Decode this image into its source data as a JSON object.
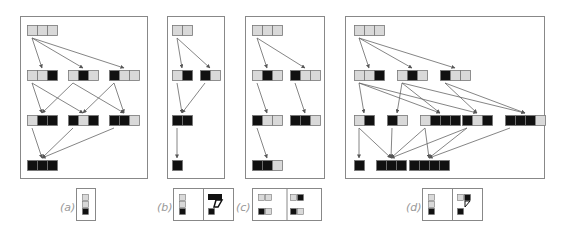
{
  "colors": {
    "light": "#d9d9d9",
    "dark": "#111111",
    "border": "#777777",
    "frame": "#888888",
    "arrow": "#666666"
  },
  "panels": [
    {
      "id": "a",
      "label": "(a)",
      "frame": [
        20,
        16,
        127,
        162
      ],
      "nodes": [
        {
          "x": 27,
          "y": 25,
          "cells": "ggg"
        },
        {
          "x": 27,
          "y": 70,
          "cells": "ggB"
        },
        {
          "x": 68,
          "y": 70,
          "cells": "gBg"
        },
        {
          "x": 109,
          "y": 70,
          "cells": "Bgg"
        },
        {
          "x": 27,
          "y": 115,
          "cells": "gBB"
        },
        {
          "x": 68,
          "y": 115,
          "cells": "BgB"
        },
        {
          "x": 109,
          "y": 115,
          "cells": "BBg"
        },
        {
          "x": 27,
          "y": 160,
          "cells": "BBB"
        }
      ],
      "edges": [
        [
          0,
          1
        ],
        [
          0,
          2
        ],
        [
          0,
          3
        ],
        [
          1,
          4
        ],
        [
          1,
          5
        ],
        [
          2,
          4
        ],
        [
          2,
          6
        ],
        [
          3,
          5
        ],
        [
          3,
          6
        ],
        [
          4,
          7
        ],
        [
          5,
          7
        ],
        [
          6,
          7
        ]
      ]
    },
    {
      "id": "b",
      "label": "(b)",
      "frame": [
        167,
        16,
        57,
        162
      ],
      "nodes": [
        {
          "x": 172,
          "y": 25,
          "cells": "gg"
        },
        {
          "x": 172,
          "y": 70,
          "cells": "gB"
        },
        {
          "x": 200,
          "y": 70,
          "cells": "Bg"
        },
        {
          "x": 172,
          "y": 115,
          "cells": "BB"
        },
        {
          "x": 172,
          "y": 160,
          "cells": "B"
        }
      ],
      "edges": [
        [
          0,
          1
        ],
        [
          0,
          2
        ],
        [
          1,
          3
        ],
        [
          2,
          3
        ],
        [
          3,
          4
        ]
      ]
    },
    {
      "id": "c",
      "label": "(c)",
      "frame": [
        245,
        16,
        79,
        162
      ],
      "nodes": [
        {
          "x": 252,
          "y": 25,
          "cells": "ggg"
        },
        {
          "x": 252,
          "y": 70,
          "cells": "gBg"
        },
        {
          "x": 290,
          "y": 70,
          "cells": "Bgg"
        },
        {
          "x": 252,
          "y": 115,
          "cells": "Bgg"
        },
        {
          "x": 290,
          "y": 115,
          "cells": "BBg"
        },
        {
          "x": 252,
          "y": 160,
          "cells": "BBg"
        }
      ],
      "edges": [
        [
          0,
          1
        ],
        [
          0,
          2
        ],
        [
          1,
          3
        ],
        [
          2,
          4
        ],
        [
          3,
          5
        ]
      ]
    },
    {
      "id": "d",
      "label": "(d)",
      "frame": [
        345,
        16,
        199,
        162
      ],
      "nodes": [
        {
          "x": 354,
          "y": 25,
          "cells": "ggg"
        },
        {
          "x": 354,
          "y": 70,
          "cells": "ggB"
        },
        {
          "x": 397,
          "y": 70,
          "cells": "gBg"
        },
        {
          "x": 440,
          "y": 70,
          "cells": "Bgg"
        },
        {
          "x": 354,
          "y": 115,
          "cells": "gB"
        },
        {
          "x": 387,
          "y": 115,
          "cells": "Bg"
        },
        {
          "x": 420,
          "y": 115,
          "cells": "gBBB"
        },
        {
          "x": 462,
          "y": 115,
          "cells": "BgB"
        },
        {
          "x": 505,
          "y": 115,
          "cells": "BBBg"
        },
        {
          "x": 354,
          "y": 160,
          "cells": "B"
        },
        {
          "x": 376,
          "y": 160,
          "cells": "BBB"
        },
        {
          "x": 409,
          "y": 160,
          "cells": "BBBB"
        }
      ],
      "edges": [
        [
          0,
          1
        ],
        [
          0,
          2
        ],
        [
          0,
          3
        ],
        [
          1,
          4
        ],
        [
          1,
          6
        ],
        [
          1,
          7
        ],
        [
          2,
          5
        ],
        [
          2,
          6
        ],
        [
          2,
          8
        ],
        [
          3,
          7
        ],
        [
          3,
          8
        ],
        [
          4,
          9
        ],
        [
          4,
          10
        ],
        [
          5,
          10
        ],
        [
          6,
          10
        ],
        [
          6,
          11
        ],
        [
          7,
          10
        ],
        [
          7,
          11
        ],
        [
          8,
          11
        ]
      ]
    }
  ],
  "legend": [
    {
      "label": "(a)",
      "lx": 60,
      "ly": 201,
      "box": [
        76,
        188,
        19,
        32
      ],
      "glyphs": [
        [
          {
            "t": "col",
            "x": 82
          }
        ]
      ]
    },
    {
      "label": "(b)",
      "lx": 157,
      "ly": 201,
      "box": [
        173,
        188,
        60,
        32
      ],
      "glyphs": [
        [
          {
            "t": "col",
            "x": 179
          }
        ],
        [
          {
            "t": "seven",
            "x": 208
          }
        ]
      ]
    },
    {
      "label": "(c)",
      "lx": 236,
      "ly": 201,
      "box": [
        252,
        188,
        69,
        32
      ],
      "glyphs": [
        [
          {
            "t": "sq1",
            "x": 258
          }
        ],
        [
          {
            "t": "sq2",
            "x": 290
          }
        ]
      ]
    },
    {
      "label": "(d)",
      "lx": 406,
      "ly": 201,
      "box": [
        422,
        188,
        60,
        32
      ],
      "glyphs": [
        [
          {
            "t": "col",
            "x": 428
          }
        ],
        [
          {
            "t": "seven2",
            "x": 457
          }
        ]
      ]
    }
  ]
}
